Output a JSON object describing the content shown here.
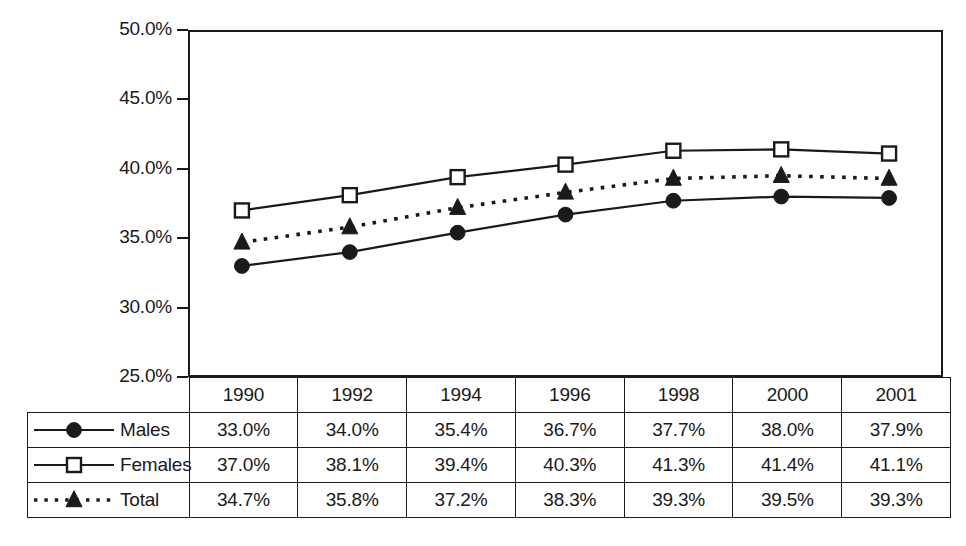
{
  "chart_data": {
    "type": "line",
    "title": "",
    "subtitle": "",
    "xlabel": "",
    "ylabel": "",
    "categories": [
      "1990",
      "1992",
      "1994",
      "1996",
      "1998",
      "2000",
      "2001"
    ],
    "ylim": [
      25.0,
      50.0
    ],
    "y_tick_labels": [
      "50.0%",
      "45.0%",
      "40.0%",
      "35.0%",
      "30.0%",
      "25.0%"
    ],
    "y_ticks": [
      50.0,
      45.0,
      40.0,
      35.0,
      30.0,
      25.0
    ],
    "grid": false,
    "legend_position": "table-row-labels",
    "series": [
      {
        "name": "Males",
        "marker": "filled-circle",
        "line_style": "solid",
        "color": "#1a1a1a",
        "values": [
          33.0,
          34.0,
          35.4,
          36.7,
          37.7,
          38.0,
          37.9
        ],
        "labels": [
          "33.0%",
          "34.0%",
          "35.4%",
          "36.7%",
          "37.7%",
          "38.0%",
          "37.9%"
        ]
      },
      {
        "name": "Females",
        "marker": "open-square",
        "line_style": "solid",
        "color": "#1a1a1a",
        "values": [
          37.0,
          38.1,
          39.4,
          40.3,
          41.3,
          41.4,
          41.1
        ],
        "labels": [
          "37.0%",
          "38.1%",
          "39.4%",
          "40.3%",
          "41.3%",
          "41.4%",
          "41.1%"
        ]
      },
      {
        "name": "Total",
        "marker": "filled-triangle",
        "line_style": "dotted",
        "color": "#1a1a1a",
        "values": [
          34.7,
          35.8,
          37.2,
          38.3,
          39.3,
          39.5,
          39.3
        ],
        "labels": [
          "34.7%",
          "35.8%",
          "37.2%",
          "38.3%",
          "39.3%",
          "39.5%",
          "39.3%"
        ]
      }
    ]
  },
  "table": {
    "header": [
      "1990",
      "1992",
      "1994",
      "1996",
      "1998",
      "2000",
      "2001"
    ],
    "rows": [
      {
        "label": "Males",
        "marker": "filled-circle",
        "line_style": "solid",
        "values": [
          "33.0%",
          "34.0%",
          "35.4%",
          "36.7%",
          "37.7%",
          "38.0%",
          "37.9%"
        ]
      },
      {
        "label": "Females",
        "marker": "open-square",
        "line_style": "solid",
        "values": [
          "37.0%",
          "38.1%",
          "39.4%",
          "40.3%",
          "41.3%",
          "41.4%",
          "41.1%"
        ]
      },
      {
        "label": "Total",
        "marker": "filled-triangle",
        "line_style": "dotted",
        "values": [
          "34.7%",
          "35.8%",
          "37.2%",
          "38.3%",
          "39.3%",
          "39.5%",
          "39.3%"
        ]
      }
    ]
  }
}
